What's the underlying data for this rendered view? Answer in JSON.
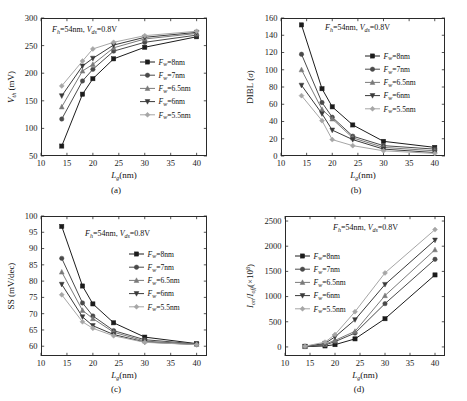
{
  "figure": {
    "background": "#ffffff",
    "panels_order": [
      "a",
      "b",
      "c",
      "d"
    ]
  },
  "series_styles": {
    "labels": [
      "F_w=8nm",
      "F_w=7nm",
      "F_w=6.5nm",
      "F_w=6nm",
      "F_w=5.5nm"
    ],
    "colors": [
      "#1c1c1c",
      "#4a4a4a",
      "#7a7a7a",
      "#3a3a3a",
      "#a6a6a6"
    ],
    "markers": [
      "square",
      "circle",
      "triangle",
      "triangle-down",
      "diamond"
    ]
  },
  "legend_common": {
    "entries": [
      {
        "label_prefix": "F",
        "label_sub": "w",
        "label_value": "=8nm",
        "full": "Fw=8nm"
      },
      {
        "label_prefix": "F",
        "label_sub": "w",
        "label_value": "=7nm",
        "full": "Fw=7nm"
      },
      {
        "label_prefix": "F",
        "label_sub": "w",
        "label_value": "=6.5nm",
        "full": "Fw=6.5nm"
      },
      {
        "label_prefix": "F",
        "label_sub": "w",
        "label_value": "=6nm",
        "full": "Fw=6nm"
      },
      {
        "label_prefix": "F",
        "label_sub": "w",
        "label_value": "=5.5nm",
        "full": "Fw=5.5nm"
      }
    ]
  },
  "annotation_common": {
    "fh_symbol": "F",
    "fh_sub": "h",
    "fh_value": "=54nm,",
    "vds_symbol": "V",
    "vds_sub": "ds",
    "vds_value": "=0.8V",
    "full": "Fh=54nm, Vds=0.8V"
  },
  "xaxis_common": {
    "symbol": "L",
    "sub": "g",
    "unit": "(nm)",
    "label_full": "Lg (nm)",
    "ticks": [
      10,
      15,
      20,
      25,
      30,
      35,
      40
    ],
    "range": [
      10,
      42
    ]
  },
  "panel_captions": {
    "a": "(a)",
    "b": "(b)",
    "c": "(c)",
    "d": "(d)"
  },
  "chart_data": [
    {
      "id": "a",
      "type": "line",
      "caption": "(a)",
      "title": "",
      "annotation": "Fh=54nm, Vds=0.8V",
      "xlabel": "Lg (nm)",
      "ylabel": "Vth (mV)",
      "ylabel_symbol": "V",
      "ylabel_sub": "th",
      "ylabel_unit": "(mV)",
      "x": [
        14,
        18,
        20,
        24,
        30,
        40
      ],
      "xlim": [
        10,
        42
      ],
      "ylim": [
        50,
        300
      ],
      "yticks": [
        50,
        100,
        150,
        200,
        250,
        300
      ],
      "xticks": [
        10,
        15,
        20,
        25,
        30,
        35,
        40
      ],
      "grid": false,
      "legend_position": "right-middle",
      "series": [
        {
          "name": "Fw=8nm",
          "values": [
            68,
            162,
            190,
            226,
            247,
            266
          ]
        },
        {
          "name": "Fw=7nm",
          "values": [
            117,
            186,
            207,
            240,
            256,
            269
          ]
        },
        {
          "name": "Fw=6.5nm",
          "values": [
            139,
            204,
            216,
            246,
            262,
            272
          ]
        },
        {
          "name": "Fw=6nm",
          "values": [
            159,
            213,
            227,
            251,
            265,
            274
          ]
        },
        {
          "name": "Fw=5.5nm",
          "values": [
            177,
            222,
            244,
            256,
            268,
            276
          ]
        }
      ]
    },
    {
      "id": "b",
      "type": "line",
      "caption": "(b)",
      "title": "",
      "annotation": "Fh=54nm, Vds=0.8V",
      "xlabel": "Lg (nm)",
      "ylabel": "DIBL (σ)",
      "ylabel_symbol": "DIBL",
      "ylabel_unit": "(σ)",
      "x": [
        14,
        18,
        20,
        24,
        30,
        40
      ],
      "xlim": [
        10,
        42
      ],
      "ylim": [
        0,
        160
      ],
      "yticks": [
        0,
        20,
        40,
        60,
        80,
        100,
        120,
        140,
        160
      ],
      "xticks": [
        10,
        15,
        20,
        25,
        30,
        35,
        40
      ],
      "grid": false,
      "legend_position": "right-middle",
      "series": [
        {
          "name": "Fw=8nm",
          "values": [
            152,
            78,
            57,
            36,
            17,
            10
          ]
        },
        {
          "name": "Fw=7nm",
          "values": [
            118,
            62,
            45,
            23,
            12,
            8
          ]
        },
        {
          "name": "Fw=6.5nm",
          "values": [
            100,
            54,
            43,
            21,
            10,
            6
          ]
        },
        {
          "name": "Fw=6nm",
          "values": [
            82,
            49,
            30,
            19,
            8,
            4
          ]
        },
        {
          "name": "Fw=5.5nm",
          "values": [
            70,
            41,
            19,
            12,
            6,
            3
          ]
        }
      ]
    },
    {
      "id": "c",
      "type": "line",
      "caption": "(c)",
      "title": "",
      "annotation": "Fh=54nm, Vds=0.8V",
      "xlabel": "Lg (nm)",
      "ylabel": "SS (mV/dec)",
      "ylabel_symbol": "SS",
      "ylabel_unit": "(mV/dec)",
      "x": [
        14,
        18,
        20,
        24,
        30,
        40
      ],
      "xlim": [
        10,
        42
      ],
      "ylim": [
        57,
        100
      ],
      "yticks": [
        60,
        65,
        70,
        75,
        80,
        85,
        90,
        95,
        100
      ],
      "xticks": [
        10,
        15,
        20,
        25,
        30,
        35,
        40
      ],
      "grid": false,
      "legend_position": "right-middle",
      "series": [
        {
          "name": "Fw=8nm",
          "values": [
            96.8,
            78.5,
            73.0,
            67.2,
            62.8,
            60.8
          ]
        },
        {
          "name": "Fw=7nm",
          "values": [
            87.0,
            73.3,
            69.3,
            64.8,
            62.0,
            60.7
          ]
        },
        {
          "name": "Fw=6.5nm",
          "values": [
            82.8,
            71.0,
            68.5,
            64.3,
            61.6,
            60.6
          ]
        },
        {
          "name": "Fw=6nm",
          "values": [
            79.0,
            69.0,
            66.3,
            63.6,
            61.3,
            60.5
          ]
        },
        {
          "name": "Fw=5.5nm",
          "values": [
            75.8,
            67.5,
            65.5,
            63.2,
            61.2,
            60.5
          ]
        }
      ]
    },
    {
      "id": "d",
      "type": "line",
      "caption": "(d)",
      "title": "",
      "annotation": "Fh=54nm, Vds=0.8V",
      "xlabel": "Lg (nm)",
      "ylabel": "Ion/Ioff(×10^8)",
      "ylabel_symbol": "I",
      "ylabel_sub1": "on",
      "ylabel_sub2": "off",
      "ylabel_unit": "(×10",
      "ylabel_exp": "8",
      "x": [
        14,
        18,
        20,
        24,
        30,
        40
      ],
      "xlim": [
        10,
        42
      ],
      "ylim": [
        -180,
        2600
      ],
      "yticks": [
        0,
        500,
        1000,
        1500,
        2000,
        2500
      ],
      "xticks": [
        10,
        15,
        20,
        25,
        30,
        35,
        40
      ],
      "grid": false,
      "legend_position": "left-middle",
      "series": [
        {
          "name": "Fw=8nm",
          "values": [
            5,
            20,
            45,
            160,
            560,
            1430
          ]
        },
        {
          "name": "Fw=7nm",
          "values": [
            8,
            40,
            105,
            275,
            860,
            1740
          ]
        },
        {
          "name": "Fw=6.5nm",
          "values": [
            10,
            55,
            130,
            310,
            1020,
            1930
          ]
        },
        {
          "name": "Fw=6nm",
          "values": [
            12,
            70,
            200,
            540,
            1240,
            2120
          ]
        },
        {
          "name": "Fw=5.5nm",
          "values": [
            15,
            95,
            245,
            700,
            1470,
            2330
          ]
        }
      ]
    }
  ]
}
